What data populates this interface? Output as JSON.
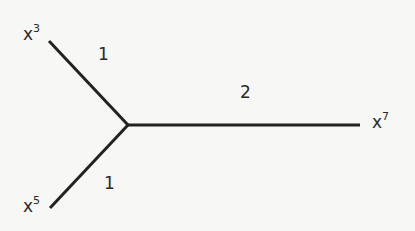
{
  "diagram": {
    "type": "tree",
    "nodes": [
      {
        "id": "x3",
        "base": "x",
        "exp": "3"
      },
      {
        "id": "x5",
        "base": "x",
        "exp": "5"
      },
      {
        "id": "x7",
        "base": "x",
        "exp": "7"
      }
    ],
    "edges": [
      {
        "from": "x3",
        "to": "center",
        "weight": "1"
      },
      {
        "from": "x5",
        "to": "center",
        "weight": "1"
      },
      {
        "from": "center",
        "to": "x7",
        "weight": "2"
      }
    ],
    "colors": {
      "line": "#222222",
      "background": "#f7f7f5"
    }
  }
}
